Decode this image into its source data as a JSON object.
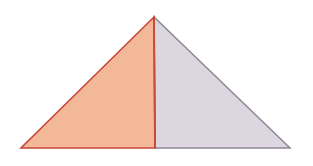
{
  "diagram": {
    "apex": [
      154,
      17
    ],
    "base_left": [
      21,
      148
    ],
    "base_right": [
      290,
      148
    ],
    "foot": [
      155,
      148
    ],
    "left_region": {
      "fill": "#f3b898",
      "stroke": "#c8483a"
    },
    "right_region": {
      "fill": "#dcd6e0",
      "stroke": "#8c8894"
    },
    "altitude_stroke": "#c8483a"
  }
}
